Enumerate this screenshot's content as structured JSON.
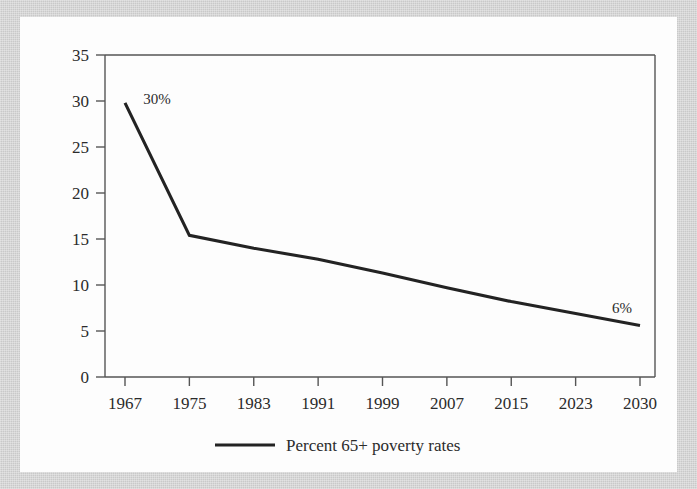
{
  "figure": {
    "background_color": "#c9c9c9",
    "card_color": "#fdfdfd",
    "line_color": "#232323",
    "axis_color": "#555555",
    "text_color": "#2b2b2b"
  },
  "chart_data": {
    "type": "line",
    "title": "",
    "xlabel": "",
    "ylabel": "",
    "x": [
      1967,
      1975,
      1983,
      1991,
      1999,
      2007,
      2015,
      2023,
      2030
    ],
    "categories": [
      "1967",
      "1975",
      "1983",
      "1991",
      "1999",
      "2007",
      "2015",
      "2023",
      "2030"
    ],
    "series": [
      {
        "name": "Percent 65+ poverty rates",
        "values": [
          29.8,
          15.4,
          14.0,
          12.8,
          11.3,
          9.7,
          8.2,
          6.9,
          5.6
        ]
      }
    ],
    "values": [
      29.8,
      15.4,
      14.0,
      12.8,
      11.3,
      9.7,
      8.2,
      6.9,
      5.6
    ],
    "ylim": [
      0,
      35
    ],
    "yticks": [
      0,
      5,
      10,
      15,
      20,
      25,
      30,
      35
    ],
    "ytick_labels": [
      "0",
      "5",
      "10",
      "15",
      "20",
      "25",
      "30",
      "35"
    ],
    "xtick_labels": [
      "1967",
      "1975",
      "1983",
      "1991",
      "1999",
      "2007",
      "2015",
      "2023",
      "2030"
    ],
    "grid": false,
    "legend_position": "bottom-center",
    "annotations": [
      {
        "text": "30%",
        "x": 1967,
        "y": 29.8
      },
      {
        "text": "6%",
        "x": 2030,
        "y": 5.6
      }
    ]
  },
  "legend": {
    "entries": [
      {
        "label": "Percent 65+ poverty rates",
        "color": "#232323"
      }
    ]
  }
}
